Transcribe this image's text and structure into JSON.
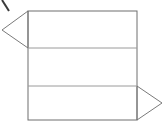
{
  "canvas": {
    "width": 164,
    "height": 128,
    "background_color": "#ffffff",
    "title": ""
  },
  "style": {
    "outline_color": "#6e6e6e",
    "divider_color": "#9a9a9a",
    "diagonal_color": "#7a7a7a",
    "mark_color": "#3a3a3a",
    "fill_color": "none",
    "stroke_width": 1
  },
  "figure": {
    "name": "banner-flag-outline-diagram"
  },
  "geometry": {
    "rectangle": {
      "name": "main-rectangle",
      "left": 28,
      "top": 11,
      "right": 137,
      "bottom": 120,
      "width": 109,
      "height": 109
    },
    "dividers": [
      {
        "name": "divider-upper",
        "y": 48,
        "x1": 28,
        "x2": 137
      },
      {
        "name": "divider-lower",
        "y": 86,
        "x1": 28,
        "x2": 137
      }
    ],
    "bands": [
      {
        "name": "band-top",
        "top": 11,
        "bottom": 48,
        "height": 37
      },
      {
        "name": "band-middle",
        "top": 48,
        "bottom": 86,
        "height": 38
      },
      {
        "name": "band-bottom",
        "top": 86,
        "bottom": 120,
        "height": 34
      }
    ],
    "left_triangle": {
      "name": "left-triangle",
      "points": "28,11 2,30 28,48",
      "apex_x": 2,
      "apex_y": 30,
      "base_top_x": 28,
      "base_top_y": 11,
      "base_bottom_x": 28,
      "base_bottom_y": 48
    },
    "right_triangle": {
      "name": "right-triangle",
      "points": "137,86 162,103 137,120",
      "apex_x": 162,
      "apex_y": 103,
      "base_top_x": 137,
      "base_top_y": 86,
      "base_bottom_x": 137,
      "base_bottom_y": 120
    },
    "corner_mark": {
      "name": "corner-mark",
      "x1": 2,
      "y1": 0,
      "x2": 9,
      "y2": 11
    }
  }
}
